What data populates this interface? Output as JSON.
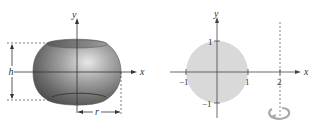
{
  "left_figure": {
    "description": "Solid torus-like shape (ring with hole) centered at origin",
    "labels": {
      "y_axis": "y",
      "x_axis": "x",
      "height": "h",
      "radius": "r"
    }
  },
  "right_figure": {
    "description": "Unit disk revolved about line x = 2",
    "labels": {
      "y_axis": "y",
      "x_axis": "x"
    },
    "x_ticks": [
      "−1",
      "1",
      "2"
    ],
    "y_ticks": [
      "1",
      "−1"
    ],
    "colors": {
      "disk": "#d9d9d9",
      "axis": "#444444"
    }
  }
}
